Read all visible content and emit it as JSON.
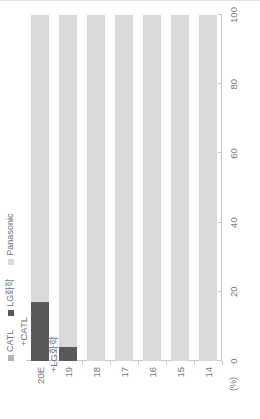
{
  "chart_data": {
    "type": "bar",
    "title": "",
    "subtitle": "",
    "xlabel": "",
    "ylabel": "(%)",
    "unit_label": "(%)",
    "orientation": "vertical-stacked-rendered-rotated",
    "stacked": true,
    "stack_total": 100,
    "grid": false,
    "legend_position": "top-left",
    "ylim": [
      0,
      100
    ],
    "yticks": [
      0,
      20,
      40,
      60,
      80,
      100
    ],
    "ytick_labels": [
      "0",
      "20",
      "40",
      "60",
      "80",
      "100"
    ],
    "categories": [
      "14",
      "15",
      "16",
      "17",
      "18",
      "19",
      "20E"
    ],
    "series": [
      {
        "name": "CATL",
        "color": "#b4b4b4",
        "values": [
          0,
          0,
          0,
          0,
          0,
          0,
          0
        ]
      },
      {
        "name": "LG화학",
        "color": "#595959",
        "values": [
          0,
          0,
          0,
          0,
          0,
          4,
          17
        ]
      },
      {
        "name": "Panasonic",
        "color": "#d9d9d9",
        "values": [
          100,
          100,
          100,
          100,
          100,
          96,
          83
        ]
      }
    ],
    "annotations": [
      {
        "category": "19",
        "text": "+LG화학"
      },
      {
        "category": "20E",
        "text": "+CATL"
      }
    ]
  },
  "legend": {
    "items": [
      {
        "label": "CATL",
        "color": "#b4b4b4"
      },
      {
        "label": "LG화학",
        "color": "#595959"
      },
      {
        "label": "Panasonic",
        "color": "#d9d9d9"
      }
    ]
  },
  "axis": {
    "unit": "(%)",
    "value_ticks": [
      "100",
      "80",
      "60",
      "40",
      "20",
      "0"
    ],
    "category_ticks": [
      "20E",
      "19",
      "18",
      "17",
      "16",
      "15",
      "14"
    ]
  },
  "annotations": {
    "items": [
      {
        "text": "+CATL"
      },
      {
        "text": "+LG화학"
      }
    ]
  }
}
